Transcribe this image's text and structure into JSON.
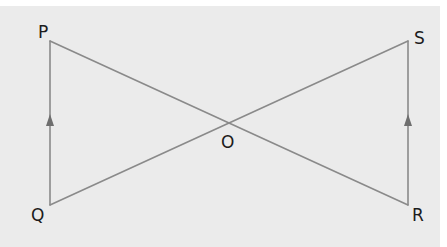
{
  "diagram": {
    "type": "geometry",
    "colors": {
      "background": "#ebebeb",
      "line": "#8a8a8a",
      "label": "#1c1c1c"
    },
    "points": [
      {
        "name": "P",
        "label": "P",
        "x": 50,
        "y": 41
      },
      {
        "name": "Q",
        "label": "Q",
        "x": 50,
        "y": 205
      },
      {
        "name": "S",
        "label": "S",
        "x": 408,
        "y": 41
      },
      {
        "name": "R",
        "label": "R",
        "x": 408,
        "y": 205
      },
      {
        "name": "O",
        "label": "O",
        "x": 229,
        "y": 123
      }
    ],
    "segments": [
      {
        "from": "P",
        "to": "Q",
        "parallel_mark": "single-arrow-up"
      },
      {
        "from": "R",
        "to": "S",
        "parallel_mark": "single-arrow-up"
      },
      {
        "from": "P",
        "to": "R"
      },
      {
        "from": "Q",
        "to": "S"
      }
    ],
    "labels": {
      "P": "P",
      "Q": "Q",
      "R": "R",
      "S": "S",
      "O": "O"
    }
  }
}
